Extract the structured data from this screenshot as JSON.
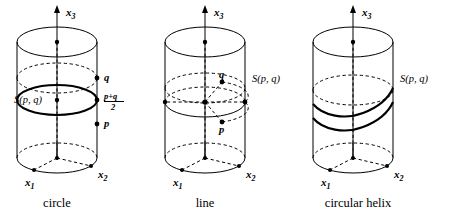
{
  "figure": {
    "background_color": "#ffffff",
    "ink_color": "#000000",
    "panels": [
      {
        "id": "panel-circle",
        "caption": "circle",
        "axes": {
          "vertical": "x",
          "vertical_sub": "3",
          "left": "x",
          "left_sub": "1",
          "right": "x",
          "right_sub": "2"
        },
        "curve_label": "S(p, q)",
        "points": [
          {
            "name": "q",
            "label": "q"
          },
          {
            "name": "midpoint",
            "label": "p+q",
            "denominator": "2"
          },
          {
            "name": "p",
            "label": "p"
          }
        ]
      },
      {
        "id": "panel-line",
        "caption": "line",
        "axes": {
          "vertical": "x",
          "vertical_sub": "3",
          "left": "x",
          "left_sub": "1",
          "right": "x",
          "right_sub": "2"
        },
        "curve_label": "S(p, q)",
        "points": [
          {
            "name": "q",
            "label": "q"
          },
          {
            "name": "p",
            "label": "p"
          }
        ]
      },
      {
        "id": "panel-helix",
        "caption": "circular helix",
        "axes": {
          "vertical": "x",
          "vertical_sub": "3",
          "left": "x",
          "left_sub": "1",
          "right": "x",
          "right_sub": "2"
        },
        "curve_label": "S(p, q)",
        "points": []
      }
    ]
  }
}
